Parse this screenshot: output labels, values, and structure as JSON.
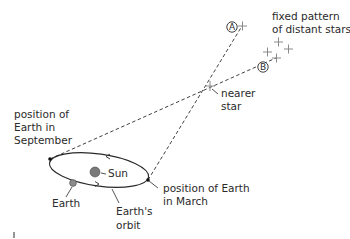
{
  "diagram": {
    "labels": {
      "fixed_pattern": [
        "fixed pattern",
        "of distant stars"
      ],
      "nearer_star": [
        "nearer",
        "star"
      ],
      "september": [
        "position of",
        "Earth in",
        "September"
      ],
      "march": [
        "position of Earth",
        "in March"
      ],
      "sun": "Sun",
      "earth": "Earth",
      "orbit": [
        "Earth's",
        "orbit"
      ],
      "marker_a": "A",
      "marker_b": "B"
    },
    "colors": {
      "line": "#2a2a2a",
      "star_cross": "#8a8a8a",
      "sun_fill": "#7a7a7a",
      "earth_fill": "#8c8c8c"
    }
  }
}
